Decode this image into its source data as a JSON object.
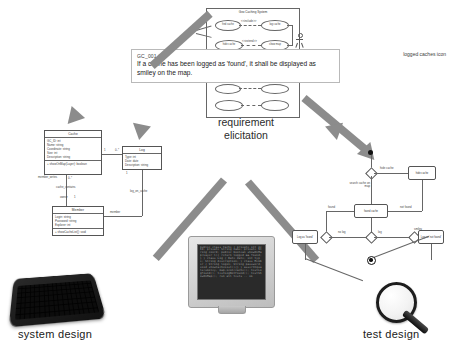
{
  "diagram": {
    "colors": {
      "arrow_gray": "#8c8c8c",
      "note_border": "#b9b9b9",
      "uml_line": "#555555",
      "screen_dark": "#2a2a2a",
      "text_dark": "#202020"
    }
  },
  "usecase": {
    "system_label": "Geo Caching System",
    "actor_left_label": "Geocacher",
    "actor_right_label": "System",
    "cases": [
      {
        "label": "find cache"
      },
      {
        "label": "log cache"
      },
      {
        "label": "hide cache"
      },
      {
        "label": "show map"
      }
    ],
    "relations": [
      {
        "label": "<<include>>"
      },
      {
        "label": "<<extend>>"
      }
    ]
  },
  "requirement": {
    "id": "GC_001.07",
    "text": "If a cache has been logged as 'found', it shall be displayed as smiley on the map.",
    "annotation": "logged caches icon"
  },
  "captions": {
    "center": "requirement\nelicitation",
    "center_line1": "requirement",
    "center_line2": "elicitation",
    "left": "system  design",
    "right": "test design"
  },
  "class_diagram": {
    "classes": [
      {
        "name": "Cache",
        "attributes": [
          "GC_ID: int",
          "Name: string",
          "Coordinate: string",
          "Size: int",
          "Description: string"
        ],
        "operations": [
          "+ showOnMap(Layer): boolean"
        ]
      },
      {
        "name": "Log",
        "attributes": [
          "Type: int",
          "Date: date",
          "Description: string"
        ],
        "operations": []
      },
      {
        "name": "Member",
        "attributes": [
          "Login: string",
          "Password: string",
          "Explorer: int"
        ],
        "operations": [
          "+ showCacheList(): void"
        ]
      }
    ],
    "associations": [
      {
        "label": "cache_contains",
        "from_mult": "1",
        "to_mult": "0..*"
      },
      {
        "label": "member_writes",
        "from_mult": "1",
        "to_mult": "0..*"
      },
      {
        "label": "log_on_cache",
        "from_mult": "0..*",
        "to_mult": "1"
      },
      {
        "label": "member",
        "from_mult": "1",
        "to_mult": "0..*"
      },
      {
        "label": "owner",
        "from_mult": "1",
        "to_mult": "1"
      }
    ]
  },
  "state_diagram": {
    "nodes": [
      {
        "id": "start",
        "type": "initial",
        "label": ""
      },
      {
        "id": "d1",
        "type": "decision",
        "label": ""
      },
      {
        "id": "hide",
        "type": "state",
        "label": "hide cache"
      },
      {
        "id": "found",
        "type": "state",
        "label": "found cache"
      },
      {
        "id": "log_found",
        "type": "state",
        "label": "Log as 'found'"
      },
      {
        "id": "log_not_found",
        "type": "state",
        "label": "Log as 'not found'"
      },
      {
        "id": "d2",
        "type": "decision",
        "label": ""
      },
      {
        "id": "d3",
        "type": "decision",
        "label": ""
      },
      {
        "id": "d4",
        "type": "decision",
        "label": ""
      },
      {
        "id": "end",
        "type": "final",
        "label": ""
      }
    ],
    "edges": [
      {
        "label": "hide cache"
      },
      {
        "label": "search cache on map"
      },
      {
        "label": "found"
      },
      {
        "label": "not found"
      },
      {
        "label": "log"
      },
      {
        "label": "not log"
      },
      {
        "label": "no log"
      },
      {
        "label": "smiley"
      }
    ]
  },
  "monitor": {
    "screen_text": "public class Cache { private int gcId; private String name; private String coord; public boolean showOnMap(Layer l){ return logged && found; } } class Log { Date date; int type; String description; } class Member { String login; String password; void showCacheList(){} } assertEquals(smiley, map.icon(cache)); testLogFound(); testLogNotFound(); testShowOnMap(); run all tests -- ok"
  }
}
